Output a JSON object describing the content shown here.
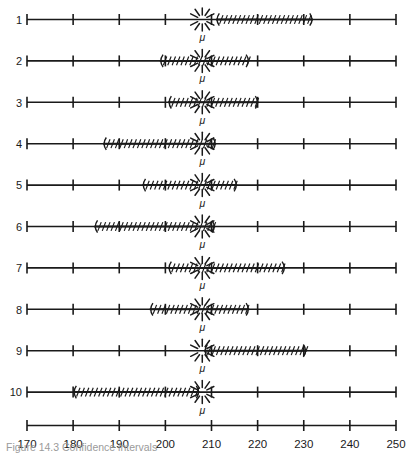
{
  "chart_data": {
    "type": "line",
    "title": "",
    "subtitle": "",
    "xlabel": "",
    "ylabel": "",
    "xlim": [
      170,
      250
    ],
    "xticks": [
      170,
      180,
      190,
      200,
      210,
      220,
      230,
      240,
      250
    ],
    "xtick_labels": [
      "170",
      "180",
      "190",
      "200",
      "210",
      "220",
      "230",
      "240",
      "250"
    ],
    "grid": false,
    "legend": false,
    "parameter_marker": {
      "label": "μ",
      "value": 208,
      "style": "starburst"
    },
    "series": [
      {
        "name": "1",
        "row_label": "1",
        "lower": 211.0,
        "upper": 232.0,
        "contains_mu": false
      },
      {
        "name": "2",
        "row_label": "2",
        "lower": 198.8,
        "upper": 218.2,
        "contains_mu": true
      },
      {
        "name": "3",
        "row_label": "3",
        "lower": 200.6,
        "upper": 220.2,
        "contains_mu": true
      },
      {
        "name": "4",
        "row_label": "4",
        "lower": 186.5,
        "upper": 211.0,
        "contains_mu": true
      },
      {
        "name": "5",
        "row_label": "5",
        "lower": 195.0,
        "upper": 215.6,
        "contains_mu": true
      },
      {
        "name": "6",
        "row_label": "6",
        "lower": 184.6,
        "upper": 210.8,
        "contains_mu": true
      },
      {
        "name": "7",
        "row_label": "7",
        "lower": 200.6,
        "upper": 226.0,
        "contains_mu": true
      },
      {
        "name": "8",
        "row_label": "8",
        "lower": 196.6,
        "upper": 218.2,
        "contains_mu": true
      },
      {
        "name": "9",
        "row_label": "9",
        "lower": 208.4,
        "upper": 230.6,
        "contains_mu": true
      },
      {
        "name": "10",
        "row_label": "10",
        "lower": 180.0,
        "upper": 207.4,
        "contains_mu": false
      }
    ]
  },
  "figure": {
    "caption": "Figure 14.3  Confidence intervals"
  },
  "colors": {
    "ink": "#1a1a1a",
    "caption": "#9a9a9a",
    "background": "#ffffff"
  }
}
